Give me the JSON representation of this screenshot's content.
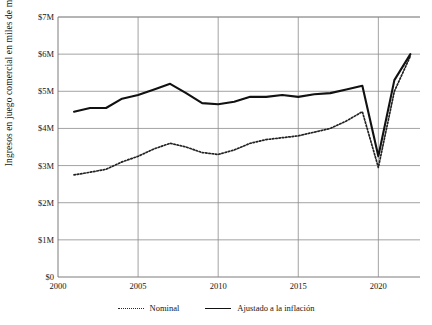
{
  "chart_data": {
    "type": "line",
    "title": "",
    "xlabel": "",
    "ylabel": "Ingresos en juego comercial en miles de millones",
    "xlim": [
      2000,
      2022.6
    ],
    "ylim": [
      0,
      7
    ],
    "grid": true,
    "legend_position": "bottom",
    "y_tick_labels": [
      "$0",
      "$1M",
      "$2M",
      "$3M",
      "$4M",
      "$5M",
      "$6M",
      "$7M"
    ],
    "y_tick_values": [
      0,
      1,
      2,
      3,
      4,
      5,
      6,
      7
    ],
    "x_tick_labels": [
      "2000",
      "2005",
      "2010",
      "2015",
      "2020"
    ],
    "x_tick_values": [
      2000,
      2005,
      2010,
      2015,
      2020
    ],
    "x": [
      2001,
      2002,
      2003,
      2004,
      2005,
      2006,
      2007,
      2008,
      2009,
      2010,
      2011,
      2012,
      2013,
      2014,
      2015,
      2016,
      2017,
      2018,
      2019,
      2020,
      2021,
      2022
    ],
    "series": [
      {
        "name": "Nominal",
        "style": "dotted",
        "color": "#222222",
        "values": [
          2.75,
          2.82,
          2.9,
          3.1,
          3.25,
          3.45,
          3.6,
          3.5,
          3.35,
          3.3,
          3.42,
          3.6,
          3.7,
          3.75,
          3.8,
          3.9,
          4.0,
          4.2,
          4.45,
          2.95,
          5.0,
          5.95
        ]
      },
      {
        "name": "Ajustado a la inflación",
        "style": "solid",
        "color": "#111111",
        "values": [
          4.45,
          4.55,
          4.55,
          4.8,
          4.9,
          5.05,
          5.2,
          4.95,
          4.68,
          4.65,
          4.72,
          4.85,
          4.85,
          4.9,
          4.85,
          4.92,
          4.95,
          5.05,
          5.15,
          3.25,
          5.3,
          6.0
        ]
      }
    ],
    "legend": [
      {
        "label": "Nominal",
        "style": "dotted"
      },
      {
        "label": "Ajustado a la inflación",
        "style": "solid"
      }
    ]
  }
}
